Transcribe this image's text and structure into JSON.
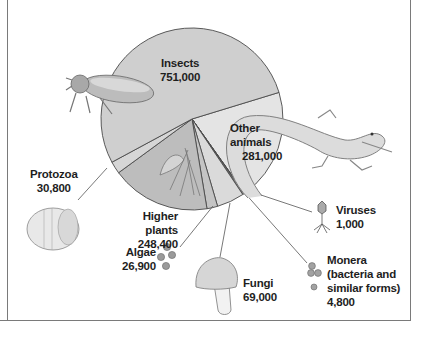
{
  "chart_data": {
    "type": "pie",
    "title": "",
    "total": 1412900,
    "slices": [
      {
        "name": "Insects",
        "value": 751000,
        "label": "751,000",
        "color": "#cfcfcf"
      },
      {
        "name": "Other animals",
        "value": 281000,
        "label": "281,000",
        "color": "#e4e4e4"
      },
      {
        "name": "Viruses",
        "value": 1000,
        "label": "1,000",
        "color": "#3a3a3a"
      },
      {
        "name": "Monera (bacteria and similar forms)",
        "value": 4800,
        "label": "4,800",
        "color": "#6e6e6e"
      },
      {
        "name": "Fungi",
        "value": 69000,
        "label": "69,000",
        "color": "#dadada"
      },
      {
        "name": "Algae",
        "value": 26900,
        "label": "26,900",
        "color": "#c4c4c4"
      },
      {
        "name": "Higher plants",
        "value": 248400,
        "label": "248,400",
        "color": "#bdbdbd"
      },
      {
        "name": "Protozoa",
        "value": 30800,
        "label": "30,800",
        "color": "#d6d6d6"
      }
    ],
    "legend_position": "callout labels"
  },
  "labels": {
    "insects": {
      "name": "Insects",
      "value": "751,000"
    },
    "other_animals": {
      "name_1": "Other",
      "name_2": "animals",
      "value": "281,000"
    },
    "protozoa": {
      "name": "Protozoa",
      "value": "30,800"
    },
    "higher_plants": {
      "name": "Higher plants",
      "value": "248,400"
    },
    "algae": {
      "name": "Algae",
      "value": "26,900"
    },
    "fungi": {
      "name": "Fungi",
      "value": "69,000"
    },
    "viruses": {
      "name": "Viruses",
      "value": "1,000"
    },
    "monera": {
      "name_1": "Monera",
      "name_2": "(bacteria and",
      "name_3": "similar forms)",
      "value": "4,800"
    }
  },
  "icons": [
    "beetle-illustration",
    "lizard-illustration",
    "protozoan-illustration",
    "plant-illustration",
    "algae-cells-illustration",
    "mushroom-illustration",
    "bacteriophage-illustration",
    "bacteria-cells-illustration"
  ]
}
